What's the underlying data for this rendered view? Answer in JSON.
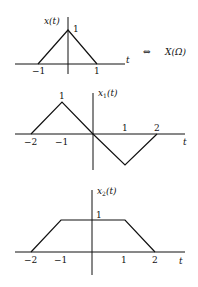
{
  "relation": {
    "symbol": "⇔",
    "transform_label": "X(Ω)"
  },
  "graphs": [
    {
      "name": "x(t)",
      "ylabel": "x(t)",
      "xlabel": "t",
      "peak_label": "1",
      "x_ticks": [
        "−1",
        "1"
      ],
      "points": [
        [
          -1,
          0
        ],
        [
          0,
          1
        ],
        [
          1,
          0
        ]
      ]
    },
    {
      "name": "x1(t)",
      "ylabel": "x",
      "ylabel_sub": "1",
      "ylabel_tail": "(t)",
      "xlabel": "t",
      "peak_label": "1",
      "x_ticks": [
        "−2",
        "−1",
        "1",
        "2"
      ],
      "points": [
        [
          -2,
          0
        ],
        [
          -1,
          1
        ],
        [
          0,
          0
        ],
        [
          1,
          -1
        ],
        [
          2,
          0
        ]
      ]
    },
    {
      "name": "x2(t)",
      "ylabel": "x",
      "ylabel_sub": "2",
      "ylabel_tail": "(t)",
      "xlabel": "t",
      "peak_label": "1",
      "x_ticks": [
        "−2",
        "−1",
        "1",
        "2"
      ],
      "points": [
        [
          -2,
          0
        ],
        [
          -1,
          1
        ],
        [
          1,
          1
        ],
        [
          2,
          0
        ]
      ]
    }
  ]
}
